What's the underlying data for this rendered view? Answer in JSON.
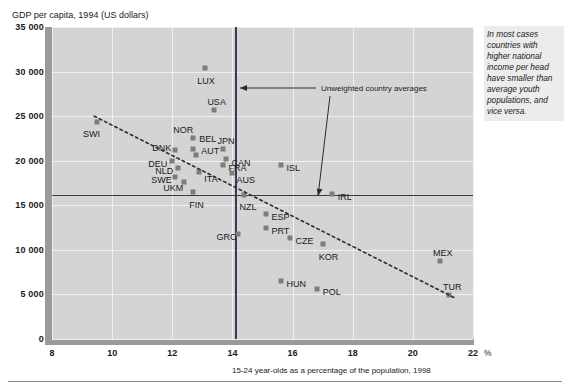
{
  "chart_data": {
    "type": "scatter",
    "title": "",
    "ylabel": "GDP per capita, 1994 (US dollars)",
    "xlabel": "15-24 year-olds as a percentage of the population, 1998",
    "xunit": "%",
    "xlim": [
      8,
      22
    ],
    "ylim": [
      0,
      35000
    ],
    "xticks": [
      "8",
      "10",
      "12",
      "14",
      "16",
      "18",
      "20",
      "22"
    ],
    "xtick_values": [
      8,
      10,
      12,
      14,
      16,
      18,
      20,
      22
    ],
    "yticks": [
      "0",
      "5 000",
      "10 000",
      "15 000",
      "20 000",
      "25 000",
      "30 000",
      "35 000"
    ],
    "ytick_values": [
      0,
      5000,
      10000,
      15000,
      20000,
      25000,
      30000,
      35000
    ],
    "grid": true,
    "legend_position": "none",
    "points": [
      {
        "label": "SWI",
        "x": 9.5,
        "y": 24300,
        "lx": -14,
        "ly": 12
      },
      {
        "label": "LUX",
        "x": 13.1,
        "y": 30400,
        "lx": -8,
        "ly": 13
      },
      {
        "label": "USA",
        "x": 13.4,
        "y": 25700,
        "lx": -7,
        "ly": -8
      },
      {
        "label": "NOR",
        "x": 12.7,
        "y": 22600,
        "lx": -20,
        "ly": -8
      },
      {
        "label": "BEL",
        "x": 12.7,
        "y": 21300,
        "lx": 6,
        "ly": -10
      },
      {
        "label": "DNK",
        "x": 12.1,
        "y": 21200,
        "lx": -23,
        "ly": -2
      },
      {
        "label": "JPN",
        "x": 13.7,
        "y": 21300,
        "lx": -6,
        "ly": -8
      },
      {
        "label": "AUT",
        "x": 12.8,
        "y": 20600,
        "lx": 5,
        "ly": -4
      },
      {
        "label": "CAN",
        "x": 13.8,
        "y": 20200,
        "lx": 5,
        "ly": 4
      },
      {
        "label": "DEU",
        "x": 12.0,
        "y": 20000,
        "lx": -24,
        "ly": 3
      },
      {
        "label": "FRA",
        "x": 13.7,
        "y": 19500,
        "lx": 5,
        "ly": 3
      },
      {
        "label": "NLD",
        "x": 12.2,
        "y": 19200,
        "lx": -23,
        "ly": 3
      },
      {
        "label": "ISL",
        "x": 15.6,
        "y": 19500,
        "lx": 6,
        "ly": 3
      },
      {
        "label": "AUS",
        "x": 14.0,
        "y": 18600,
        "lx": 4,
        "ly": 7
      },
      {
        "label": "ITA",
        "x": 12.9,
        "y": 18700,
        "lx": 5,
        "ly": 7
      },
      {
        "label": "SWE",
        "x": 12.1,
        "y": 18200,
        "lx": -24,
        "ly": 3
      },
      {
        "label": "UKM",
        "x": 12.4,
        "y": 17600,
        "lx": -21,
        "ly": 6
      },
      {
        "label": "FIN",
        "x": 12.7,
        "y": 16500,
        "lx": -4,
        "ly": 13
      },
      {
        "label": "NZL",
        "x": 14.4,
        "y": 16100,
        "lx": -5,
        "ly": 12
      },
      {
        "label": "IRL",
        "x": 17.3,
        "y": 16300,
        "lx": 6,
        "ly": 3
      },
      {
        "label": "ESP",
        "x": 15.1,
        "y": 14000,
        "lx": 6,
        "ly": 3
      },
      {
        "label": "PRT",
        "x": 15.1,
        "y": 12500,
        "lx": 6,
        "ly": 3
      },
      {
        "label": "GRC",
        "x": 14.2,
        "y": 11800,
        "lx": -22,
        "ly": 3
      },
      {
        "label": "CZE",
        "x": 15.9,
        "y": 11300,
        "lx": 6,
        "ly": 3
      },
      {
        "label": "KOR",
        "x": 17.0,
        "y": 10700,
        "lx": -4,
        "ly": 13
      },
      {
        "label": "MEX",
        "x": 20.9,
        "y": 8800,
        "lx": -7,
        "ly": -8
      },
      {
        "label": "HUN",
        "x": 15.6,
        "y": 6500,
        "lx": 6,
        "ly": 3
      },
      {
        "label": "POL",
        "x": 16.8,
        "y": 5600,
        "lx": 6,
        "ly": 3
      },
      {
        "label": "TUR",
        "x": 21.2,
        "y": 4900,
        "lx": -6,
        "ly": -8
      }
    ],
    "trendline": {
      "x1": 9.4,
      "y1": 25000,
      "x2": 21.4,
      "y2": 4600,
      "style": "dashed"
    },
    "reference_lines": [
      {
        "orient": "vertical",
        "value": 14.1,
        "label": "Unweighted country averages"
      },
      {
        "orient": "horizontal",
        "value": 16200,
        "label": "Unweighted country averages"
      }
    ]
  },
  "annotation": {
    "callout": "Unweighted country averages",
    "note": "In most cases countries with higher national income per head have smaller than average youth populations, and vice versa."
  },
  "colors": {
    "plot_background": "#d4d4d4",
    "marker": "#7d7d7d",
    "reference_line": "#3a3a55",
    "grid": "#f0f0f0",
    "axis_band": "#9a9a9a",
    "note_background": "#ececec"
  }
}
